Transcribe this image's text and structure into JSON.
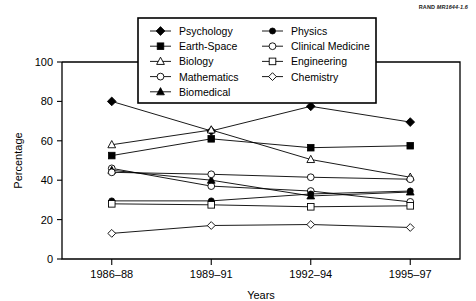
{
  "source_note": {
    "prefix": "RAND ",
    "code": "MR1644-1.6"
  },
  "chart_data": {
    "type": "line",
    "title": "",
    "xlabel": "Years",
    "ylabel": "Percentage",
    "categories": [
      "1986–88",
      "1989–91",
      "1992–94",
      "1995–97"
    ],
    "ylim": [
      0,
      100
    ],
    "yticks": [
      0,
      20,
      40,
      60,
      80,
      100
    ],
    "grid": false,
    "legend_position": "top-center",
    "legend_columns": 2,
    "series": [
      {
        "name": "Psychology",
        "marker": "filled-diamond",
        "values": [
          80.0,
          65.0,
          77.5,
          69.5
        ]
      },
      {
        "name": "Earth-Space",
        "marker": "filled-square",
        "values": [
          52.5,
          61.0,
          56.5,
          57.5
        ]
      },
      {
        "name": "Biology",
        "marker": "open-triangle",
        "values": [
          58.0,
          65.5,
          50.5,
          41.5
        ]
      },
      {
        "name": "Mathematics",
        "marker": "open-circle",
        "values": [
          46.0,
          37.0,
          34.5,
          29.0
        ]
      },
      {
        "name": "Biomedical",
        "marker": "filled-triangle",
        "values": [
          45.0,
          40.0,
          32.0,
          34.0
        ]
      },
      {
        "name": "Physics",
        "marker": "filled-circle",
        "values": [
          29.5,
          29.5,
          33.0,
          34.5
        ]
      },
      {
        "name": "Clinical Medicine",
        "marker": "open-circle",
        "values": [
          44.0,
          43.0,
          41.5,
          40.5
        ]
      },
      {
        "name": "Engineering",
        "marker": "open-square",
        "values": [
          28.0,
          27.5,
          26.5,
          27.0
        ]
      },
      {
        "name": "Chemistry",
        "marker": "open-diamond",
        "values": [
          13.0,
          17.0,
          17.5,
          16.0
        ]
      }
    ],
    "legend_order": [
      "Psychology",
      "Physics",
      "Earth-Space",
      "Clinical Medicine",
      "Biology",
      "Engineering",
      "Mathematics",
      "Chemistry",
      "Biomedical"
    ]
  }
}
